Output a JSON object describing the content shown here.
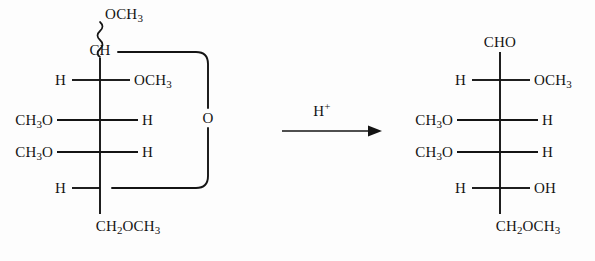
{
  "document": {
    "kind": "chemical-reaction-scheme",
    "description": "Fischer projection of a methylated pyranoside hydrolyzing to an open-chain aldehyde"
  },
  "reactant": {
    "name": "methyl tetra-O-methyl-glycopyranoside",
    "top_label": "OCH3",
    "anomeric_carbon": "CH",
    "bond_to_top": "wavy",
    "ring_oxygen": "O",
    "bottom_label": "CH2OCH3",
    "rows": [
      {
        "left": "H",
        "right": "OCH3"
      },
      {
        "left": "CH3O",
        "right": "H"
      },
      {
        "left": "CH3O",
        "right": "H"
      },
      {
        "left": "H",
        "right": ""
      }
    ]
  },
  "arrow": {
    "reagent": "H+",
    "direction": "right"
  },
  "product": {
    "name": "tetra-O-methyl aldose (open chain)",
    "top_label": "CHO",
    "bottom_label": "CH2OCH3",
    "rows": [
      {
        "left": "H",
        "right": "OCH3"
      },
      {
        "left": "CH3O",
        "right": "H"
      },
      {
        "left": "CH3O",
        "right": "H"
      },
      {
        "left": "H",
        "right": "OH"
      }
    ]
  },
  "colors": {
    "ink": "#141414",
    "background": "#fdfdfd"
  }
}
